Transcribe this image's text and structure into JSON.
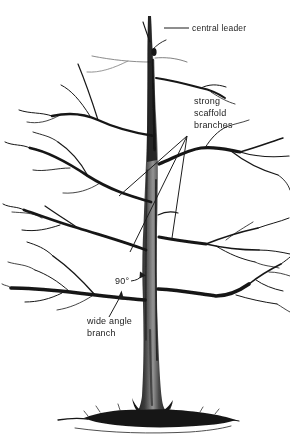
{
  "figure": {
    "type": "tree-pruning-illustration",
    "background_color": "#ffffff",
    "ink_color": "#1a1a1a",
    "shading_color": "#8f8f8f"
  },
  "labels": {
    "central_leader": "central leader",
    "scaffold": {
      "line1": "strong",
      "line2": "scaffold",
      "line3": "branches"
    },
    "angle": "90°",
    "wide_angle": {
      "line1": "wide angle",
      "line2": "branch"
    }
  }
}
